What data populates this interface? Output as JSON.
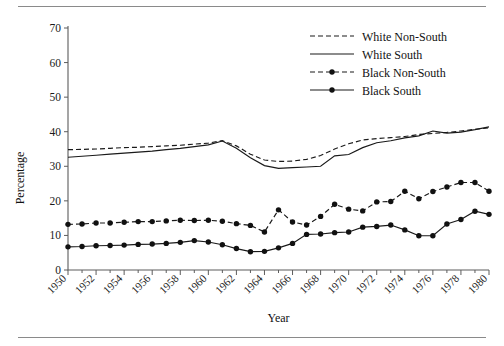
{
  "figure": {
    "top_rule": "horizontal-rule",
    "bottom_rule": "horizontal-rule"
  },
  "chart_data": {
    "type": "line",
    "title": "",
    "xlabel": "Year",
    "ylabel": "Percentage",
    "xlim": [
      1950,
      1980
    ],
    "ylim": [
      0,
      70
    ],
    "yticks": [
      0,
      10,
      20,
      30,
      40,
      50,
      60,
      70
    ],
    "xticks": [
      1950,
      1952,
      1954,
      1956,
      1958,
      1960,
      1962,
      1964,
      1966,
      1968,
      1970,
      1972,
      1974,
      1976,
      1978,
      1980
    ],
    "xtick_labels": [
      "1950",
      "1952",
      "1954",
      "1956",
      "1958",
      "1960",
      "1962",
      "1964",
      "1966",
      "1968",
      "1970",
      "1972",
      "1974",
      "1976",
      "1978",
      "1980"
    ],
    "ytick_labels": [
      "0",
      "10",
      "20",
      "30",
      "40",
      "50",
      "60",
      "70"
    ],
    "grid": false,
    "legend_position": "top-right",
    "x": [
      1950,
      1951,
      1952,
      1953,
      1954,
      1955,
      1956,
      1957,
      1958,
      1959,
      1960,
      1961,
      1962,
      1963,
      1964,
      1965,
      1966,
      1967,
      1968,
      1969,
      1970,
      1971,
      1972,
      1973,
      1974,
      1975,
      1976,
      1977,
      1978,
      1979,
      1980
    ],
    "series": [
      {
        "name": "White Non-South",
        "style": "dashed",
        "markers": false,
        "values": [
          34.8,
          34.9,
          35.0,
          35.2,
          35.4,
          35.5,
          35.7,
          35.9,
          36.1,
          36.4,
          36.7,
          37.4,
          35.9,
          33.5,
          31.8,
          31.4,
          31.5,
          32.0,
          33.1,
          35.0,
          36.5,
          37.6,
          38.0,
          38.3,
          38.6,
          39.2,
          39.5,
          39.8,
          40.2,
          40.7,
          41.1
        ]
      },
      {
        "name": "White South",
        "style": "solid",
        "markers": false,
        "values": [
          32.6,
          32.9,
          33.2,
          33.5,
          33.8,
          34.1,
          34.4,
          34.8,
          35.2,
          35.7,
          36.2,
          37.3,
          35.2,
          32.5,
          30.2,
          29.4,
          29.6,
          29.8,
          30.0,
          33.0,
          33.4,
          35.4,
          36.8,
          37.4,
          38.2,
          38.8,
          40.2,
          39.6,
          39.9,
          40.6,
          41.4
        ]
      },
      {
        "name": "Black Non-South",
        "style": "dashed",
        "markers": true,
        "values": [
          13.2,
          13.3,
          13.6,
          13.6,
          13.8,
          14.0,
          14.0,
          14.2,
          14.4,
          14.3,
          14.4,
          14.1,
          13.4,
          12.9,
          11.0,
          17.4,
          13.9,
          13.0,
          15.5,
          19.0,
          17.6,
          17.1,
          19.7,
          19.8,
          22.8,
          20.6,
          22.7,
          24.0,
          25.3,
          25.3,
          22.8
        ]
      },
      {
        "name": "Black South",
        "style": "solid",
        "markers": true,
        "values": [
          6.7,
          6.8,
          7.0,
          7.1,
          7.2,
          7.4,
          7.5,
          7.7,
          8.0,
          8.5,
          8.1,
          7.3,
          6.2,
          5.3,
          5.4,
          6.4,
          7.7,
          10.3,
          10.4,
          10.8,
          11.0,
          12.4,
          12.6,
          13.0,
          11.6,
          9.9,
          9.9,
          13.3,
          14.6,
          17.0,
          16.1
        ]
      }
    ]
  },
  "legend": {
    "items": [
      {
        "label": "White Non-South",
        "style": "dashed",
        "markers": false
      },
      {
        "label": "White South",
        "style": "solid",
        "markers": false
      },
      {
        "label": "Black Non-South",
        "style": "dashed",
        "markers": true
      },
      {
        "label": "Black South",
        "style": "solid",
        "markers": true
      }
    ]
  }
}
